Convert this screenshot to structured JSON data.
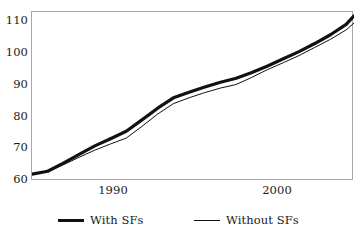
{
  "chart_data": {
    "type": "line",
    "title": "",
    "subtitle": "",
    "xlabel": "",
    "ylabel": "",
    "xlim": [
      1985,
      2005.5
    ],
    "ylim": [
      60,
      112
    ],
    "grid": false,
    "legend_position": "bottom",
    "x_tick_labels": [
      "1990",
      "2000"
    ],
    "x_ticks": [
      1990,
      2000
    ],
    "y_tick_labels": [
      "110",
      "100",
      "90",
      "80",
      "70",
      "60"
    ],
    "y_ticks": [
      110,
      100,
      90,
      80,
      70,
      60
    ],
    "x": [
      1985,
      1986,
      1987,
      1988,
      1989,
      1990,
      1991,
      1992,
      1993,
      1994,
      1995,
      1996,
      1997,
      1998,
      1999,
      2000,
      2001,
      2002,
      2003,
      2004,
      2005,
      2005.5
    ],
    "series": [
      {
        "name": "With SFs",
        "style": "thick",
        "color": "#111111",
        "width": 3.2,
        "values": [
          62.1,
          63.0,
          65.5,
          68.2,
          70.8,
          73.0,
          75.3,
          78.8,
          82.4,
          85.6,
          87.3,
          88.9,
          90.4,
          91.6,
          93.4,
          95.4,
          97.6,
          99.8,
          102.3,
          105.0,
          108.2,
          110.8
        ]
      },
      {
        "name": "Without SFs",
        "style": "thin",
        "color": "#111111",
        "width": 1,
        "values": [
          62.1,
          62.9,
          65.0,
          67.3,
          69.5,
          71.4,
          73.2,
          76.8,
          80.6,
          83.8,
          85.6,
          87.2,
          88.6,
          89.7,
          91.9,
          94.3,
          96.4,
          98.6,
          101.1,
          103.6,
          106.5,
          108.6
        ]
      }
    ],
    "legend": [
      {
        "label": "With SFs",
        "style": "thick"
      },
      {
        "label": "Without SFs",
        "style": "thin"
      }
    ],
    "colors": {
      "frame": "#a8a8a8",
      "line": "#111111",
      "background": "#ffffff",
      "text": "#1a1a1a"
    }
  }
}
